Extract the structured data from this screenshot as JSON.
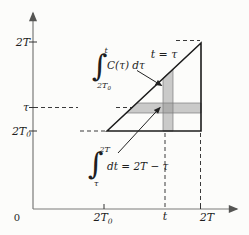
{
  "colors": {
    "axis": "#7a7a78",
    "line": "#1c1c1c",
    "dash": "#3a3a3a",
    "strip_fill": "#8f8f8f",
    "strip_edge": "#7d7d7d",
    "arrow": "#222222"
  },
  "y_axis": {
    "tick_2t": "2T",
    "tick_tau": "τ",
    "tick_2t0_main": "2T",
    "tick_2t0_sub": "0"
  },
  "x_axis": {
    "origin": "0",
    "tick_2t0_main": "2T",
    "tick_2t0_sub": "0",
    "tick_t": "t",
    "tick_2t": "2T"
  },
  "diagonal": {
    "label": "t = τ"
  },
  "integral_top": {
    "sign": "∫",
    "upper": "t",
    "lower_main": "2T",
    "lower_sub": "0",
    "body": "C(τ) dτ"
  },
  "integral_bottom": {
    "sign": "∫",
    "upper": "2T",
    "lower": "τ",
    "body": "dt = 2T − τ"
  }
}
